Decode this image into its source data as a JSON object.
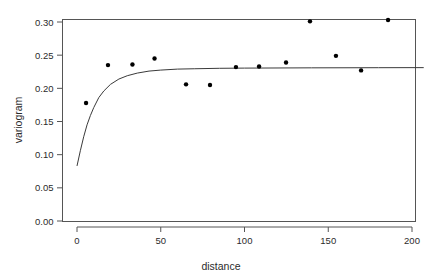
{
  "chart_data": {
    "type": "scatter",
    "title": "",
    "xlabel": "distance",
    "ylabel": "variogram",
    "xlim": [
      0,
      207
    ],
    "ylim": [
      0.0,
      0.31
    ],
    "xticks": [
      0,
      50,
      100,
      150,
      200
    ],
    "xtick_labels": [
      "0",
      "50",
      "100",
      "150",
      "200"
    ],
    "yticks": [
      0.0,
      0.05,
      0.1,
      0.15,
      0.2,
      0.25,
      0.3
    ],
    "ytick_labels": [
      "0.00",
      "0.05",
      "0.10",
      "0.15",
      "0.20",
      "0.25",
      "0.30"
    ],
    "grid": false,
    "legend": false,
    "point_color": "#000000",
    "curve_color": "#3a3a3a",
    "series": [
      {
        "name": "empirical variogram",
        "type": "scatter",
        "marker": "filled-circle",
        "x": [
          5.4,
          18.5,
          33.1,
          46.3,
          65.1,
          79.4,
          94.9,
          108.7,
          124.8,
          139.1,
          154.6,
          169.6,
          185.7
        ],
        "y": [
          0.178,
          0.235,
          0.236,
          0.245,
          0.206,
          0.205,
          0.232,
          0.233,
          0.239,
          0.301,
          0.249,
          0.227,
          0.303
        ]
      },
      {
        "name": "fitted model",
        "type": "line",
        "x": [
          0,
          2,
          4,
          6,
          8,
          10,
          13,
          16,
          20,
          25,
          30,
          36,
          43,
          50,
          60,
          70,
          85,
          100,
          120,
          140,
          160,
          180,
          200,
          207
        ],
        "y": [
          0.083,
          0.106,
          0.127,
          0.145,
          0.159,
          0.171,
          0.186,
          0.196,
          0.206,
          0.214,
          0.219,
          0.223,
          0.226,
          0.2275,
          0.229,
          0.2295,
          0.2302,
          0.2305,
          0.2307,
          0.2309,
          0.231,
          0.2311,
          0.2312,
          0.2312
        ]
      }
    ]
  },
  "axes": {
    "x_title": "distance",
    "y_title": "variogram"
  }
}
